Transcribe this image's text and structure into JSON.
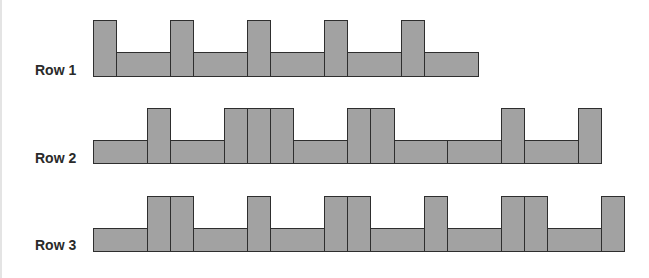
{
  "diagram": {
    "colors": {
      "fill": "#a2a2a2",
      "stroke": "#2e2e2e",
      "label": "#2a2a2a"
    },
    "bar_widths": {
      "tall": 23.3,
      "short": 53.6
    },
    "rows": [
      {
        "label": "Row 1",
        "tall_top": 20,
        "short_top": 52,
        "bottom": 77,
        "label_top": 62,
        "start_x": 93,
        "sequence": [
          "T",
          "S",
          "T",
          "S",
          "T",
          "S",
          "T",
          "S",
          "T",
          "S"
        ]
      },
      {
        "label": "Row 2",
        "tall_top": 108,
        "short_top": 140,
        "bottom": 164,
        "label_top": 150,
        "start_x": 93,
        "sequence": [
          "S",
          "T",
          "S",
          "T",
          "T",
          "T",
          "S",
          "T",
          "T",
          "S",
          "S",
          "T",
          "S",
          "T"
        ]
      },
      {
        "label": "Row 3",
        "tall_top": 196,
        "short_top": 228,
        "bottom": 252,
        "label_top": 237,
        "start_x": 93,
        "sequence": [
          "S",
          "T",
          "T",
          "S",
          "T",
          "S",
          "T",
          "T",
          "S",
          "T",
          "S",
          "T",
          "T",
          "S",
          "T"
        ]
      }
    ]
  }
}
